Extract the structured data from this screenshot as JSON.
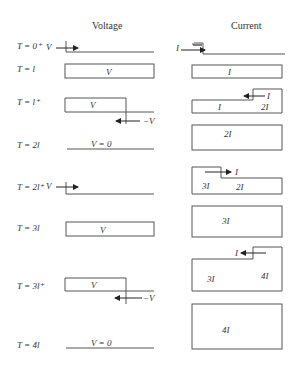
{
  "headers": {
    "voltage": "Voltage",
    "current": "Current"
  },
  "rows": [
    {
      "time": "T = 0⁺",
      "voltage": {
        "label": "V",
        "kind": "step-front"
      },
      "current": {
        "label": "I",
        "kind": "step-front"
      }
    },
    {
      "time": "T = l",
      "voltage": {
        "label": "V",
        "kind": "full"
      },
      "current": {
        "label": "I",
        "kind": "full"
      }
    },
    {
      "time": "T = l⁺",
      "voltage": {
        "label": "V",
        "reflected": "−V",
        "kind": "reflect-open"
      },
      "current": {
        "labels": [
          "I",
          "2I"
        ],
        "reflected": "I",
        "kind": "reflect-step"
      }
    },
    {
      "time": "T = 2l",
      "voltage": {
        "label": "V = 0",
        "kind": "zero"
      },
      "current": {
        "label": "2I",
        "kind": "full"
      }
    },
    {
      "time": "T = 2l⁺",
      "voltage": {
        "label": "V",
        "kind": "step-front"
      },
      "current": {
        "labels": [
          "3I",
          "2I"
        ],
        "incident": "I",
        "kind": "step-forward"
      }
    },
    {
      "time": "T = 3l",
      "voltage": {
        "label": "V",
        "kind": "full"
      },
      "current": {
        "label": "3I",
        "kind": "full"
      }
    },
    {
      "time": "T = 3l⁺",
      "voltage": {
        "label": "V",
        "reflected": "−V",
        "kind": "reflect-open"
      },
      "current": {
        "labels": [
          "3I",
          "4I"
        ],
        "reflected": "I",
        "kind": "reflect-step"
      }
    },
    {
      "time": "T = 4l",
      "voltage": {
        "label": "V = 0",
        "kind": "zero"
      },
      "current": {
        "label": "4I",
        "kind": "full"
      }
    }
  ]
}
